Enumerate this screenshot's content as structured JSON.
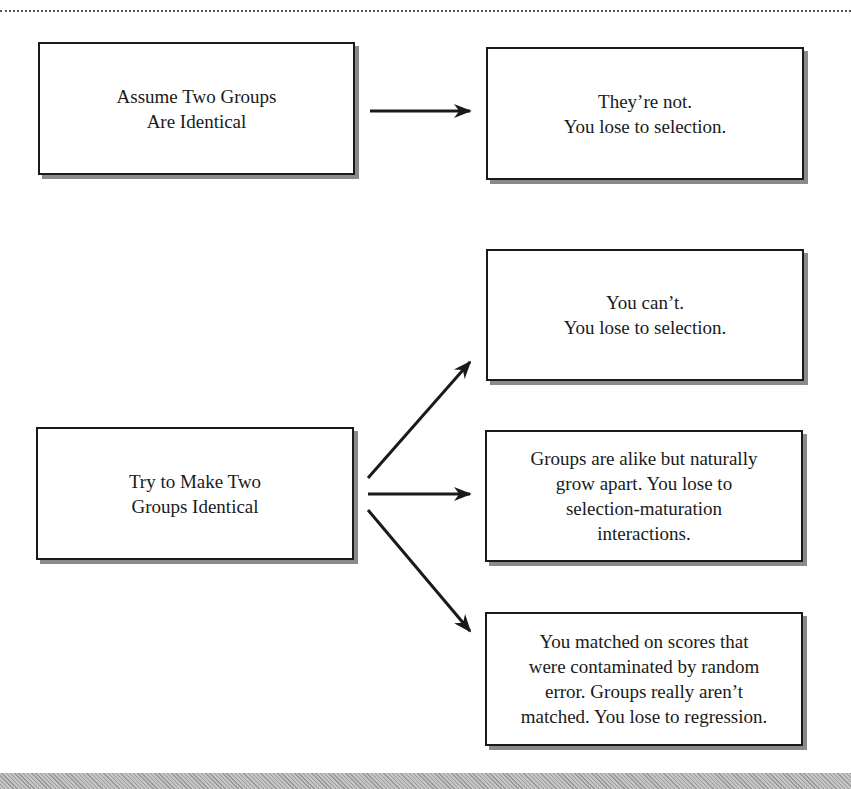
{
  "diagram": {
    "source_boxes": [
      {
        "id": "assume",
        "lines": [
          "Assume Two Groups",
          "Are Identical"
        ]
      },
      {
        "id": "try",
        "lines": [
          "Try to Make Two",
          "Groups Identical"
        ]
      }
    ],
    "outcome_boxes": [
      {
        "id": "theyre-not",
        "lines": [
          "They’re not.",
          "You lose to selection."
        ]
      },
      {
        "id": "you-cant",
        "lines": [
          "You can’t.",
          "You lose to selection."
        ]
      },
      {
        "id": "grow-apart",
        "lines": [
          "Groups are alike but naturally",
          "grow apart. You lose to",
          "selection-maturation",
          "interactions."
        ]
      },
      {
        "id": "regression",
        "lines": [
          "You matched on scores that",
          "were contaminated by random",
          "error. Groups really aren’t",
          "matched. You lose to regression."
        ]
      }
    ],
    "edges": [
      {
        "from": "assume",
        "to": "theyre-not"
      },
      {
        "from": "try",
        "to": "you-cant"
      },
      {
        "from": "try",
        "to": "grow-apart"
      },
      {
        "from": "try",
        "to": "regression"
      }
    ]
  }
}
